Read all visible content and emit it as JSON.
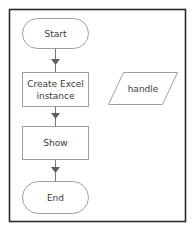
{
  "diagram": {
    "type": "flowchart",
    "nodes": [
      {
        "id": "start",
        "shape": "terminal",
        "label": "Start"
      },
      {
        "id": "create_excel",
        "shape": "process",
        "label_line1": "Create Excel",
        "label_line2": "instance"
      },
      {
        "id": "show",
        "shape": "process",
        "label": "Show"
      },
      {
        "id": "end",
        "shape": "terminal",
        "label": "End"
      },
      {
        "id": "handle",
        "shape": "data",
        "label": "handle"
      }
    ],
    "edges": [
      {
        "from": "start",
        "to": "create_excel"
      },
      {
        "from": "create_excel",
        "to": "show"
      },
      {
        "from": "show",
        "to": "end"
      }
    ],
    "colors": {
      "frame": "#2b2b2b",
      "shape_stroke": "#9a9a9a",
      "arrow": "#666666",
      "text": "#3a3a3a"
    }
  }
}
